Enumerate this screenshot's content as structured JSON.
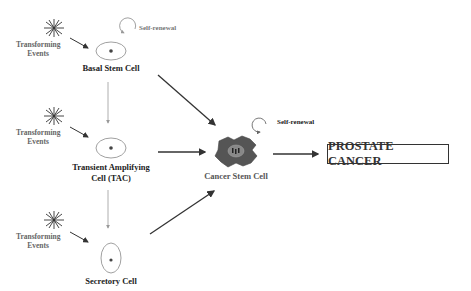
{
  "diagram": {
    "transforming_events": [
      {
        "line1": "Transforming",
        "line2": "Events"
      },
      {
        "line1": "Transforming",
        "line2": "Events"
      },
      {
        "line1": "Transforming",
        "line2": "Events"
      }
    ],
    "cells": {
      "basal": {
        "label": "Basal Stem Cell",
        "self_renewal": "Self-renewal"
      },
      "tac": {
        "line1": "Transient Amplifying",
        "line2": "Cell (TAC)"
      },
      "secretory": {
        "label": "Secretory Cell"
      },
      "cancer_stem": {
        "label": "Cancer Stem Cell",
        "self_renewal": "Self-renewal"
      }
    },
    "outcome": {
      "label": "PROSTATE CANCER"
    },
    "colors": {
      "line_dark": "#333333",
      "line_gray": "#999999",
      "cancer_cell_fill": "#555555",
      "nucleus_fill": "#888888",
      "text_dark": "#222222",
      "text_gray": "#666666"
    }
  }
}
